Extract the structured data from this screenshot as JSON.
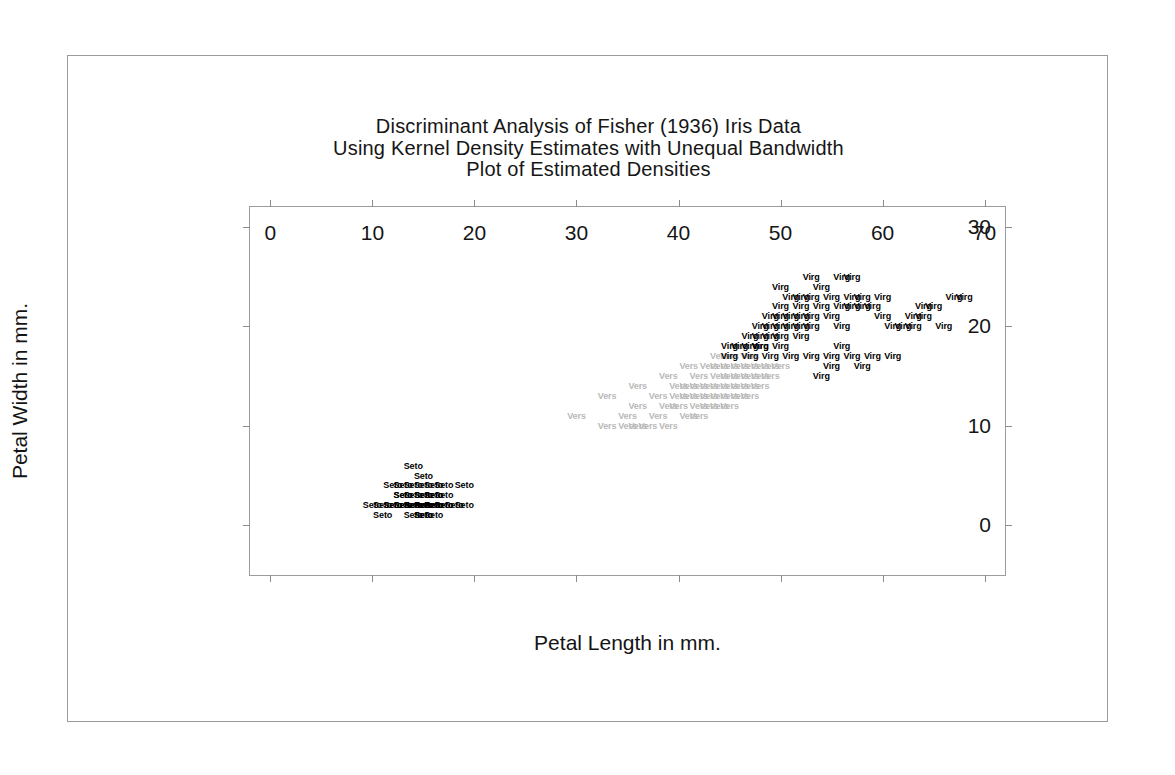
{
  "figure": {
    "title_lines": [
      "Discriminant Analysis of Fisher (1936) Iris Data",
      "Using Kernel Density Estimates with Unequal Bandwidth",
      "Plot of Estimated Densities"
    ]
  },
  "chart_data": {
    "type": "scatter",
    "title": "Discriminant Analysis of Fisher (1936) Iris Data\nUsing Kernel Density Estimates with Unequal Bandwidth\nPlot of Estimated Densities",
    "xlabel": "Petal Length in mm.",
    "ylabel": "Petal Width in mm.",
    "xlim": [
      -2,
      72
    ],
    "ylim": [
      -5,
      32
    ],
    "xticks": [
      0,
      10,
      20,
      30,
      40,
      50,
      60,
      70
    ],
    "yticks": [
      0,
      10,
      20,
      30
    ],
    "xtick_labels": [
      "0",
      "10",
      "20",
      "30",
      "40",
      "50",
      "60",
      "70"
    ],
    "ytick_labels": [
      "0",
      "10",
      "20",
      "30"
    ],
    "grid": false,
    "legend": "none",
    "marker_style": "text-label",
    "series": [
      {
        "name": "Setosa",
        "label": "Seto",
        "color": "#000000",
        "points": [
          [
            14,
            6
          ],
          [
            15,
            5
          ],
          [
            12,
            4
          ],
          [
            13,
            4
          ],
          [
            14,
            4
          ],
          [
            15,
            4
          ],
          [
            16,
            4
          ],
          [
            17,
            4
          ],
          [
            19,
            4
          ],
          [
            13,
            3
          ],
          [
            14,
            3
          ],
          [
            15,
            3
          ],
          [
            16,
            3
          ],
          [
            17,
            3
          ],
          [
            10,
            2
          ],
          [
            11,
            2
          ],
          [
            12,
            2
          ],
          [
            13,
            2
          ],
          [
            14,
            2
          ],
          [
            14,
            2
          ],
          [
            15,
            2
          ],
          [
            15,
            2
          ],
          [
            15,
            2
          ],
          [
            16,
            2
          ],
          [
            16,
            2
          ],
          [
            16,
            2
          ],
          [
            17,
            2
          ],
          [
            18,
            2
          ],
          [
            19,
            2
          ],
          [
            11,
            1
          ],
          [
            14,
            1
          ],
          [
            15,
            1
          ],
          [
            16,
            1
          ],
          [
            13,
            3
          ],
          [
            15,
            3
          ],
          [
            16,
            2
          ],
          [
            14,
            2
          ],
          [
            15,
            2
          ],
          [
            13,
            2
          ],
          [
            16,
            2
          ],
          [
            17,
            2
          ],
          [
            15,
            2
          ],
          [
            14,
            2
          ],
          [
            16,
            3
          ],
          [
            15,
            2
          ],
          [
            12,
            2
          ],
          [
            15,
            1
          ],
          [
            16,
            2
          ],
          [
            14,
            2
          ],
          [
            15,
            2
          ]
        ]
      },
      {
        "name": "Versicolor",
        "label": "Vers",
        "color": "#b9b9b9",
        "points": [
          [
            33,
            10
          ],
          [
            35,
            10
          ],
          [
            36,
            10
          ],
          [
            37,
            10
          ],
          [
            39,
            10
          ],
          [
            35,
            11
          ],
          [
            38,
            11
          ],
          [
            41,
            11
          ],
          [
            30,
            11
          ],
          [
            36,
            12
          ],
          [
            39,
            12
          ],
          [
            40,
            12
          ],
          [
            42,
            12
          ],
          [
            43,
            12
          ],
          [
            45,
            12
          ],
          [
            33,
            13
          ],
          [
            38,
            13
          ],
          [
            40,
            13
          ],
          [
            41,
            13
          ],
          [
            42,
            13
          ],
          [
            43,
            13
          ],
          [
            44,
            13
          ],
          [
            45,
            13
          ],
          [
            47,
            13
          ],
          [
            36,
            14
          ],
          [
            40,
            14
          ],
          [
            41,
            14
          ],
          [
            42,
            14
          ],
          [
            43,
            14
          ],
          [
            44,
            14
          ],
          [
            45,
            14
          ],
          [
            46,
            14
          ],
          [
            47,
            14
          ],
          [
            39,
            15
          ],
          [
            42,
            15
          ],
          [
            44,
            15
          ],
          [
            45,
            15
          ],
          [
            46,
            15
          ],
          [
            47,
            15
          ],
          [
            48,
            15
          ],
          [
            41,
            16
          ],
          [
            43,
            16
          ],
          [
            44,
            16
          ],
          [
            45,
            16
          ],
          [
            46,
            16
          ],
          [
            48,
            16
          ],
          [
            49,
            16
          ],
          [
            44,
            17
          ],
          [
            45,
            17
          ],
          [
            47,
            17
          ],
          [
            46,
            18
          ],
          [
            48,
            14
          ],
          [
            49,
            15
          ],
          [
            50,
            16
          ],
          [
            47,
            16
          ],
          [
            46,
            13
          ],
          [
            44,
            12
          ],
          [
            42,
            11
          ]
        ]
      },
      {
        "name": "Virginica",
        "label": "Virg",
        "color": "#000000",
        "points": [
          [
            53,
            25
          ],
          [
            56,
            25
          ],
          [
            57,
            25
          ],
          [
            50,
            24
          ],
          [
            54,
            24
          ],
          [
            51,
            23
          ],
          [
            52,
            23
          ],
          [
            53,
            23
          ],
          [
            55,
            23
          ],
          [
            57,
            23
          ],
          [
            58,
            23
          ],
          [
            60,
            23
          ],
          [
            67,
            23
          ],
          [
            68,
            23
          ],
          [
            52,
            22
          ],
          [
            54,
            22
          ],
          [
            56,
            22
          ],
          [
            57,
            22
          ],
          [
            58,
            22
          ],
          [
            59,
            22
          ],
          [
            65,
            22
          ],
          [
            49,
            21
          ],
          [
            50,
            21
          ],
          [
            51,
            21
          ],
          [
            52,
            21
          ],
          [
            53,
            21
          ],
          [
            55,
            21
          ],
          [
            63,
            21
          ],
          [
            64,
            21
          ],
          [
            48,
            20
          ],
          [
            49,
            20
          ],
          [
            50,
            20
          ],
          [
            51,
            20
          ],
          [
            52,
            20
          ],
          [
            53,
            20
          ],
          [
            61,
            20
          ],
          [
            63,
            20
          ],
          [
            66,
            20
          ],
          [
            47,
            19
          ],
          [
            48,
            19
          ],
          [
            49,
            19
          ],
          [
            50,
            19
          ],
          [
            46,
            18
          ],
          [
            47,
            18
          ],
          [
            48,
            18
          ],
          [
            50,
            18
          ],
          [
            56,
            18
          ],
          [
            45,
            18
          ],
          [
            47,
            17
          ],
          [
            49,
            17
          ],
          [
            51,
            17
          ],
          [
            53,
            17
          ],
          [
            55,
            17
          ],
          [
            57,
            17
          ],
          [
            59,
            17
          ],
          [
            61,
            17
          ],
          [
            55,
            16
          ],
          [
            58,
            16
          ],
          [
            54,
            15
          ],
          [
            45,
            17
          ],
          [
            48,
            18
          ],
          [
            52,
            19
          ],
          [
            56,
            20
          ],
          [
            60,
            21
          ],
          [
            62,
            20
          ],
          [
            64,
            22
          ],
          [
            50,
            22
          ]
        ]
      }
    ]
  },
  "axes": {
    "x": {
      "title": "Petal Length in mm.",
      "ticks": [
        {
          "value": 0,
          "label": "0"
        },
        {
          "value": 10,
          "label": "10"
        },
        {
          "value": 20,
          "label": "20"
        },
        {
          "value": 30,
          "label": "30"
        },
        {
          "value": 40,
          "label": "40"
        },
        {
          "value": 50,
          "label": "50"
        },
        {
          "value": 60,
          "label": "60"
        },
        {
          "value": 70,
          "label": "70"
        }
      ]
    },
    "y": {
      "title": "Petal Width in mm.",
      "ticks": [
        {
          "value": 0,
          "label": "0"
        },
        {
          "value": 10,
          "label": "10"
        },
        {
          "value": 20,
          "label": "20"
        },
        {
          "value": 30,
          "label": "30"
        }
      ]
    }
  }
}
